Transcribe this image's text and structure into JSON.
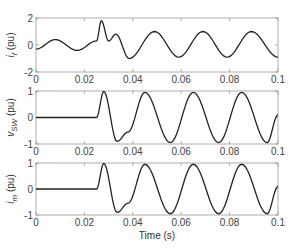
{
  "chart_data": [
    {
      "type": "line",
      "title": "",
      "xlabel": "",
      "ylabel": "i_f (pu)",
      "ylabel_main": "i",
      "ylabel_sub": "f",
      "ylabel_unit": " (pu)",
      "xlim": [
        0,
        0.1
      ],
      "ylim": [
        -2,
        2
      ],
      "xticks": [
        "0",
        "0.02",
        "0.04",
        "0.06",
        "0.08",
        "0.1"
      ],
      "yticks": [
        "2",
        "0",
        "-2"
      ],
      "grid": false,
      "series": [
        {
          "name": "i_f",
          "x": [
            0,
            0.008,
            0.017,
            0.025,
            0.027,
            0.03,
            0.033,
            0.0385,
            0.049,
            0.059,
            0.069,
            0.079,
            0.089,
            0.1
          ],
          "y": [
            -0.3,
            0.4,
            -0.4,
            0.3,
            1.8,
            0.3,
            0.8,
            -1.0,
            1.0,
            -0.9,
            1.0,
            -0.9,
            1.0,
            -0.9
          ]
        }
      ]
    },
    {
      "type": "line",
      "title": "",
      "xlabel": "",
      "ylabel": "v_SW (pu)",
      "ylabel_main": "v",
      "ylabel_sub": "SW",
      "ylabel_unit": " (pu)",
      "xlim": [
        0,
        0.1
      ],
      "ylim": [
        -1,
        1
      ],
      "xticks": [
        "0",
        "0.02",
        "0.04",
        "0.06",
        "0.08",
        "0.1"
      ],
      "yticks": [
        "1",
        "0",
        "-1"
      ],
      "grid": false,
      "series": [
        {
          "name": "v_SW",
          "x": [
            0,
            0.025,
            0.028,
            0.0335,
            0.038,
            0.045,
            0.0555,
            0.065,
            0.0755,
            0.085,
            0.0955,
            0.1
          ],
          "y": [
            0,
            0,
            0.98,
            -0.9,
            -0.55,
            0.95,
            -0.95,
            0.95,
            -0.95,
            0.95,
            -0.95,
            0.1
          ]
        }
      ]
    },
    {
      "type": "line",
      "title": "",
      "xlabel": "Time (s)",
      "ylabel": "i_m (pu)",
      "ylabel_main": "i",
      "ylabel_sub": "m",
      "ylabel_unit": " (pu)",
      "xlim": [
        0,
        0.1
      ],
      "ylim": [
        -1,
        1
      ],
      "xticks": [
        "0",
        "0.02",
        "0.04",
        "0.06",
        "0.08",
        "0.1"
      ],
      "yticks": [
        "1",
        "0",
        "-1"
      ],
      "grid": false,
      "series": [
        {
          "name": "i_m",
          "x": [
            0,
            0.025,
            0.028,
            0.0335,
            0.038,
            0.045,
            0.0555,
            0.065,
            0.0755,
            0.085,
            0.0955,
            0.1
          ],
          "y": [
            0,
            0,
            0.98,
            -0.9,
            -0.55,
            0.95,
            -0.95,
            0.95,
            -0.95,
            0.95,
            -0.95,
            0.1
          ]
        }
      ]
    }
  ]
}
